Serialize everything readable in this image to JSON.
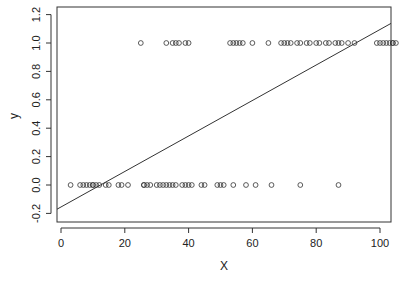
{
  "chart_data": {
    "type": "scatter",
    "title": "",
    "xlabel": "X",
    "ylabel": "y",
    "xlim": [
      -3,
      104
    ],
    "ylim": [
      -0.25,
      1.25
    ],
    "x_ticks": [
      0,
      20,
      40,
      60,
      80,
      100
    ],
    "y_ticks": [
      -0.2,
      0.0,
      0.2,
      0.4,
      0.6,
      0.8,
      1.0,
      1.2
    ],
    "x_tick_labels": [
      "0",
      "20",
      "40",
      "60",
      "80",
      "100"
    ],
    "y_tick_labels": [
      "-0.2",
      "0.0",
      "0.2",
      "0.4",
      "0.6",
      "0.8",
      "1.0",
      "1.2"
    ],
    "grid": false,
    "legend": null,
    "series": [
      {
        "name": "y = 1",
        "marker": "open-circle",
        "y": 1,
        "x": [
          25,
          33,
          35,
          36,
          37,
          39,
          40,
          53,
          54,
          55,
          56,
          57,
          60,
          65,
          69,
          70,
          71,
          72,
          74,
          75,
          77,
          78,
          80,
          81,
          83,
          84,
          86,
          87,
          88,
          90,
          92,
          99,
          100,
          101,
          102,
          103,
          104,
          104,
          105
        ]
      },
      {
        "name": "y = 0",
        "marker": "open-circle",
        "y": 0,
        "x": [
          3,
          6,
          7,
          8,
          9,
          10,
          10,
          11,
          12,
          14,
          15,
          18,
          19,
          21,
          26,
          26,
          27,
          28,
          30,
          31,
          32,
          33,
          34,
          35,
          36,
          38,
          39,
          40,
          41,
          44,
          45,
          49,
          50,
          51,
          54,
          58,
          61,
          66,
          75,
          87
        ]
      }
    ],
    "fit_line": {
      "intercept": -0.155,
      "slope": 0.0125,
      "x_range": [
        -2,
        105
      ]
    }
  }
}
